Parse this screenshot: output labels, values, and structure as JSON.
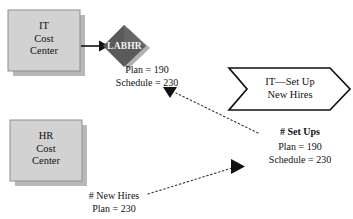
{
  "diagram": {
    "type": "activity-based-costing-flow",
    "nodes": {
      "it_cost_center": {
        "label": "IT\nCost\nCenter",
        "shape": "rectangle",
        "fill": "#d0d0d0"
      },
      "hr_cost_center": {
        "label": "HR\nCost\nCenter",
        "shape": "rectangle",
        "fill": "#d0d0d0"
      },
      "resource_driver": {
        "label": "LABHR",
        "shape": "diamond",
        "fill": "#555555"
      },
      "activity": {
        "label": "IT—Set Up\nNew Hires",
        "shape": "chevron",
        "fill": "#ffffff"
      }
    },
    "annotations": {
      "it_driver_values": "Plan = 190\nSchedule = 230",
      "setups_title": "# Set Ups",
      "setups_values": "Plan = 190\nSchedule = 230",
      "new_hires": "# New Hires\nPlan = 230"
    },
    "connectors": [
      {
        "name": "it-to-driver",
        "style": "solid",
        "from": "it_cost_center",
        "to": "resource_driver"
      },
      {
        "name": "activity-to-it-driver",
        "style": "dotted",
        "from": "activity",
        "to": "it_driver_values"
      },
      {
        "name": "new-hires-to-activity",
        "style": "dotted",
        "from": "new_hires",
        "to": "activity"
      }
    ],
    "colors": {
      "box_fill": "#d0d0d0",
      "box_stroke": "#8a8a8a",
      "diamond_fill": "#555555",
      "shadow": "#b5b5b5",
      "line": "#111111",
      "text": "#111111"
    }
  }
}
